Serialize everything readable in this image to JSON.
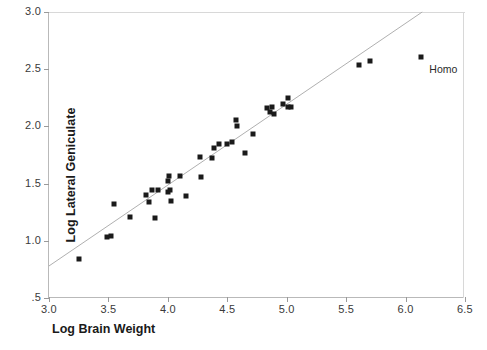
{
  "chart_data": {
    "type": "scatter",
    "title": "",
    "xlabel": "Log Brain Weight",
    "ylabel": "Log Lateral Geniculate",
    "xlim": [
      3.0,
      6.5
    ],
    "ylim": [
      0.5,
      3.0
    ],
    "xticks": [
      3.0,
      4.0,
      5.0,
      6.0
    ],
    "xtick_labels": [
      "3.0",
      "3.5",
      "4.0",
      "4.5",
      "5.0",
      "5.5",
      "6.0",
      "6.5"
    ],
    "xtick_values": [
      3.0,
      3.5,
      4.0,
      4.5,
      5.0,
      5.5,
      6.0,
      6.5
    ],
    "ytick_labels": [
      ".5",
      "1.0",
      "1.5",
      "2.0",
      "2.5",
      "3.0"
    ],
    "ytick_values": [
      0.5,
      1.0,
      1.5,
      2.0,
      2.5,
      3.0
    ],
    "grid": false,
    "legend": null,
    "marker": "filled-square",
    "marker_color": "#1a1a1a",
    "fit_line": {
      "type": "linear-regression",
      "color": "#b0b0b0",
      "x_start": 3.0,
      "y_start": 0.78,
      "x_end": 6.14,
      "y_end": 3.0,
      "slope": 0.707,
      "intercept": -1.342
    },
    "points": [
      {
        "x": 3.25,
        "y": 0.84
      },
      {
        "x": 3.49,
        "y": 1.03
      },
      {
        "x": 3.52,
        "y": 1.04
      },
      {
        "x": 3.55,
        "y": 1.32
      },
      {
        "x": 3.68,
        "y": 1.21
      },
      {
        "x": 3.82,
        "y": 1.4
      },
      {
        "x": 3.84,
        "y": 1.34
      },
      {
        "x": 3.87,
        "y": 1.44
      },
      {
        "x": 3.89,
        "y": 1.2
      },
      {
        "x": 3.92,
        "y": 1.44
      },
      {
        "x": 4.0,
        "y": 1.52
      },
      {
        "x": 4.0,
        "y": 1.43
      },
      {
        "x": 4.01,
        "y": 1.57
      },
      {
        "x": 4.02,
        "y": 1.44
      },
      {
        "x": 4.03,
        "y": 1.35
      },
      {
        "x": 4.1,
        "y": 1.57
      },
      {
        "x": 4.15,
        "y": 1.39
      },
      {
        "x": 4.27,
        "y": 1.73
      },
      {
        "x": 4.28,
        "y": 1.56
      },
      {
        "x": 4.37,
        "y": 1.72
      },
      {
        "x": 4.39,
        "y": 1.81
      },
      {
        "x": 4.43,
        "y": 1.85
      },
      {
        "x": 4.5,
        "y": 1.85
      },
      {
        "x": 4.54,
        "y": 1.86
      },
      {
        "x": 4.57,
        "y": 2.06
      },
      {
        "x": 4.58,
        "y": 2.0
      },
      {
        "x": 4.65,
        "y": 1.77
      },
      {
        "x": 4.72,
        "y": 1.93
      },
      {
        "x": 4.83,
        "y": 2.16
      },
      {
        "x": 4.86,
        "y": 2.13
      },
      {
        "x": 4.88,
        "y": 2.17
      },
      {
        "x": 4.89,
        "y": 2.11
      },
      {
        "x": 4.97,
        "y": 2.2
      },
      {
        "x": 5.01,
        "y": 2.25
      },
      {
        "x": 5.01,
        "y": 2.17
      },
      {
        "x": 5.04,
        "y": 2.17
      },
      {
        "x": 5.61,
        "y": 2.54
      },
      {
        "x": 5.7,
        "y": 2.57
      },
      {
        "x": 6.13,
        "y": 2.61,
        "label": "Homo"
      }
    ],
    "annotations": [
      {
        "text": "Homo",
        "x": 6.2,
        "y": 2.5
      }
    ]
  }
}
